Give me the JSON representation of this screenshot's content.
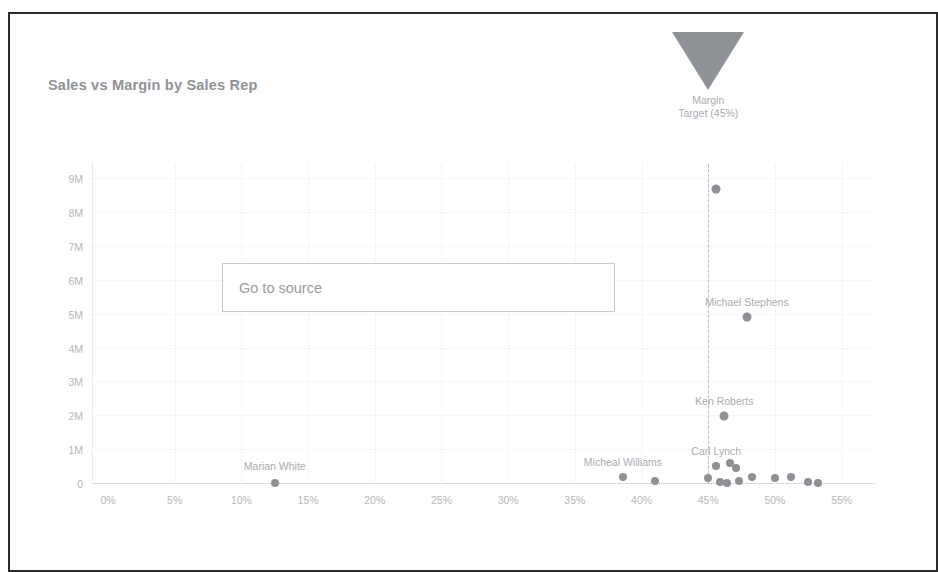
{
  "chart": {
    "title": "Sales vs Margin by Sales Rep"
  },
  "source_button": {
    "label": "Go to source"
  },
  "chart_data": {
    "type": "scatter",
    "title": "Sales vs Margin by Sales Rep",
    "xlabel": "",
    "ylabel": "",
    "xlim": [
      -1.2,
      57.5
    ],
    "ylim": [
      0,
      9.45
    ],
    "grid": true,
    "legend": null,
    "x_tick_labels": [
      "0%",
      "5%",
      "10%",
      "15%",
      "20%",
      "25%",
      "30%",
      "35%",
      "40%",
      "45%",
      "50%",
      "55%"
    ],
    "x_tick_values": [
      0,
      5,
      10,
      15,
      20,
      25,
      30,
      35,
      40,
      45,
      50,
      55
    ],
    "y_tick_labels": [
      "0",
      "1M",
      "2M",
      "3M",
      "4M",
      "5M",
      "6M",
      "7M",
      "8M",
      "9M"
    ],
    "y_tick_values": [
      0,
      1,
      2,
      3,
      4,
      5,
      6,
      7,
      8,
      9
    ],
    "annotations": [
      {
        "name": "margin-target",
        "label_line1": "Margin",
        "label_line2": "Target (45%)",
        "x": 45,
        "marker": "inverted-triangle",
        "line_style": "dashed"
      }
    ],
    "point_labels": [
      {
        "label": "Marian White",
        "x": 12.5,
        "y": 0.08
      },
      {
        "label": "Micheal Williams",
        "x": 38.6,
        "y": 0.22
      },
      {
        "label": "Ken Roberts",
        "x": 46.2,
        "y": 2.0
      },
      {
        "label": "Carl Lynch",
        "x": 45.6,
        "y": 0.52
      },
      {
        "label": "Michael Stephens",
        "x": 47.9,
        "y": 4.92
      }
    ],
    "points": [
      {
        "x": 12.5,
        "y": 0.02,
        "label": "Marian White"
      },
      {
        "x": 38.6,
        "y": 0.22,
        "label": "Micheal Williams"
      },
      {
        "x": 41.0,
        "y": 0.1,
        "label": ""
      },
      {
        "x": 45.0,
        "y": 0.18,
        "label": ""
      },
      {
        "x": 45.6,
        "y": 0.52,
        "label": "Carl Lynch"
      },
      {
        "x": 45.9,
        "y": 0.06,
        "label": ""
      },
      {
        "x": 46.2,
        "y": 2.0,
        "label": "Ken Roberts"
      },
      {
        "x": 46.4,
        "y": 0.04,
        "label": ""
      },
      {
        "x": 46.6,
        "y": 0.62,
        "label": ""
      },
      {
        "x": 47.1,
        "y": 0.48,
        "label": ""
      },
      {
        "x": 47.3,
        "y": 0.1,
        "label": ""
      },
      {
        "x": 47.9,
        "y": 4.92,
        "label": "Michael Stephens"
      },
      {
        "x": 48.3,
        "y": 0.2,
        "label": ""
      },
      {
        "x": 45.6,
        "y": 8.7,
        "label": ""
      },
      {
        "x": 50.0,
        "y": 0.18,
        "label": ""
      },
      {
        "x": 51.2,
        "y": 0.2,
        "label": ""
      },
      {
        "x": 52.5,
        "y": 0.05,
        "label": ""
      },
      {
        "x": 53.2,
        "y": 0.02,
        "label": ""
      }
    ]
  }
}
